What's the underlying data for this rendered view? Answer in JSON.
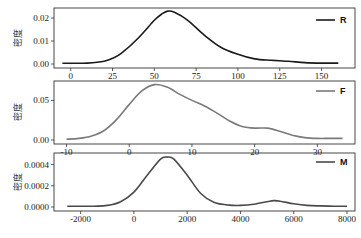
{
  "chart_data": [
    {
      "type": "line",
      "title": "",
      "xlabel": "",
      "ylabel": "密度",
      "legend": [
        "R"
      ],
      "legend_position": "upper right",
      "grid": false,
      "color": "#1a1a1a",
      "xlim": [
        -10,
        170
      ],
      "ylim": [
        0,
        0.0235
      ],
      "xticks": [
        0,
        25,
        50,
        75,
        100,
        125,
        150
      ],
      "yticks": [
        0.0,
        0.01,
        0.02
      ],
      "ytick_labels": [
        "0.00",
        "0.01",
        "0.02"
      ],
      "x": [
        -5,
        0,
        10,
        20,
        25,
        30,
        40,
        50,
        55,
        58,
        62,
        70,
        80,
        90,
        100,
        110,
        120,
        130,
        140,
        150,
        160
      ],
      "y": [
        0.0003,
        0.0003,
        0.0004,
        0.0012,
        0.0025,
        0.0045,
        0.011,
        0.019,
        0.022,
        0.023,
        0.0225,
        0.019,
        0.0125,
        0.0072,
        0.0042,
        0.0022,
        0.0016,
        0.0012,
        0.0006,
        0.0004,
        0.0004
      ]
    },
    {
      "type": "line",
      "title": "",
      "xlabel": "",
      "ylabel": "密度",
      "legend": [
        "F"
      ],
      "legend_position": "upper right",
      "grid": false,
      "color": "#7a7a7a",
      "xlim": [
        -12,
        36
      ],
      "ylim": [
        0,
        0.072
      ],
      "xticks": [
        -10,
        0,
        10,
        20,
        30
      ],
      "yticks": [
        0.0,
        0.05
      ],
      "ytick_labels": [
        "0.00",
        "0.05"
      ],
      "x": [
        -10,
        -8,
        -6,
        -4,
        -2,
        0,
        2,
        4,
        6,
        8,
        10,
        12,
        14,
        16,
        18,
        20,
        22,
        24,
        26,
        28,
        30,
        32,
        34
      ],
      "y": [
        0.001,
        0.002,
        0.005,
        0.012,
        0.026,
        0.045,
        0.062,
        0.07,
        0.067,
        0.058,
        0.05,
        0.043,
        0.034,
        0.024,
        0.017,
        0.015,
        0.015,
        0.011,
        0.006,
        0.003,
        0.002,
        0.002,
        0.002
      ]
    },
    {
      "type": "line",
      "title": "",
      "xlabel": "",
      "ylabel": "密度",
      "legend": [
        "M"
      ],
      "legend_position": "upper right",
      "grid": false,
      "color": "#4a4a4a",
      "xlim": [
        -3000,
        8300
      ],
      "ylim": [
        0,
        0.00049
      ],
      "xticks": [
        -2000,
        0,
        2000,
        4000,
        6000,
        8000
      ],
      "yticks": [
        0.0,
        0.0002,
        0.0004
      ],
      "ytick_labels": [
        "0.0000",
        "0.0002",
        "0.0004"
      ],
      "x": [
        -2500,
        -2000,
        -1500,
        -1000,
        -500,
        0,
        500,
        1000,
        1250,
        1500,
        2000,
        2500,
        3000,
        3500,
        4000,
        4500,
        5000,
        5250,
        5500,
        6000,
        6500,
        7000,
        7500,
        8000
      ],
      "y": [
        8e-06,
        8e-06,
        8e-06,
        1.5e-05,
        5e-05,
        0.00014,
        0.0003,
        0.00045,
        0.00047,
        0.00045,
        0.0003,
        0.00013,
        4.5e-05,
        2e-05,
        1.5e-05,
        2.5e-05,
        5e-05,
        6e-05,
        5.5e-05,
        3e-05,
        1.5e-05,
        1e-05,
        8e-06,
        8e-06
      ]
    }
  ],
  "panels": [
    {
      "legend_label": "R",
      "ylabel": "密度"
    },
    {
      "legend_label": "F",
      "ylabel": "密度"
    },
    {
      "legend_label": "M",
      "ylabel": "密度"
    }
  ]
}
